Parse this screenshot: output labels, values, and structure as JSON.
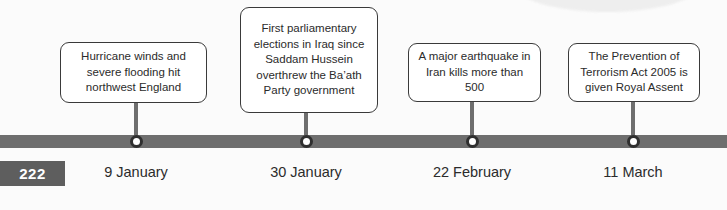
{
  "page": {
    "number": "222"
  },
  "timeline": {
    "bar_color": "#6e6e6e",
    "node_color": "#2f2f2f",
    "text_color": "#2b2b2b",
    "events": [
      {
        "date": "9 January",
        "text": "Hurricane winds and severe flooding hit northwest England"
      },
      {
        "date": "30 January",
        "text": "First parliamentary elections in Iraq since Saddam Hussein overthrew the Ba’ath Party government"
      },
      {
        "date": "22 February",
        "text": "A major earthquake in Iran kills more than 500"
      },
      {
        "date": "11 March",
        "text": "The Prevention of Terrorism Act 2005 is given Royal Assent"
      }
    ]
  }
}
